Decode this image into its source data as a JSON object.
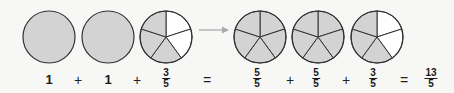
{
  "colors": {
    "shaded": "#d3d3d3",
    "unshaded": "#ffffff",
    "stroke": "#333333",
    "arrow": "#a9a9a9",
    "background": "#f7f7f5"
  },
  "pies": [
    {
      "id": "pie-1",
      "cx": 49,
      "cy": 37,
      "r": 26,
      "parts": 1,
      "shaded": 1
    },
    {
      "id": "pie-2",
      "cx": 108,
      "cy": 37,
      "r": 26,
      "parts": 1,
      "shaded": 1
    },
    {
      "id": "pie-3",
      "cx": 166,
      "cy": 37,
      "r": 26,
      "parts": 5,
      "shaded": 3
    },
    {
      "id": "pie-4",
      "cx": 260,
      "cy": 37,
      "r": 26,
      "parts": 5,
      "shaded": 5
    },
    {
      "id": "pie-5",
      "cx": 318,
      "cy": 37,
      "r": 26,
      "parts": 5,
      "shaded": 5
    },
    {
      "id": "pie-6",
      "cx": 377,
      "cy": 37,
      "r": 26,
      "parts": 5,
      "shaded": 3
    }
  ],
  "arrow": {
    "from": "mixed-form",
    "to": "fraction-form",
    "direction": "right"
  },
  "equation_left": {
    "term1": "1",
    "plus1": "+",
    "term2": "1",
    "plus2": "+",
    "term3": {
      "numerator": "3",
      "denominator": "5"
    },
    "equals": "="
  },
  "equation_right": {
    "term1": {
      "numerator": "5",
      "denominator": "5"
    },
    "plus1": "+",
    "term2": {
      "numerator": "5",
      "denominator": "5"
    },
    "plus2": "+",
    "term3": {
      "numerator": "3",
      "denominator": "5"
    },
    "equals": "=",
    "result": {
      "numerator": "13",
      "denominator": "5"
    }
  }
}
